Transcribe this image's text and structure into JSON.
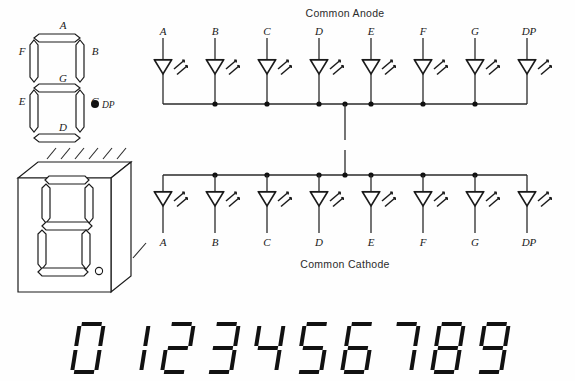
{
  "figure": {
    "segment_map": {
      "title": "seven-segment-layout",
      "segments": [
        {
          "id": "A",
          "label": "A",
          "position": "top"
        },
        {
          "id": "B",
          "label": "B",
          "position": "upper-right"
        },
        {
          "id": "C",
          "label": "C",
          "position": "lower-right"
        },
        {
          "id": "D",
          "label": "D",
          "position": "bottom"
        },
        {
          "id": "E",
          "label": "E",
          "position": "lower-left"
        },
        {
          "id": "F",
          "label": "F",
          "position": "upper-left"
        },
        {
          "id": "G",
          "label": "G",
          "position": "middle"
        }
      ],
      "decimal_point": {
        "label": "DP",
        "symbol": "filled-dot"
      }
    },
    "package_view": {
      "title": "display-package-isometric",
      "hatch_strokes": 6,
      "has_decimal_point": true
    },
    "common_anode": {
      "title": "Common Anode",
      "pins": [
        "A",
        "B",
        "C",
        "D",
        "E",
        "F",
        "G",
        "DP"
      ],
      "led_count": 8,
      "bus_position": "bottom",
      "lead_position": "top",
      "junction_dots": [
        "B",
        "C",
        "D",
        "center-tap",
        "E",
        "F",
        "G"
      ],
      "center_tap_direction": "down"
    },
    "common_cathode": {
      "title": "Common  Cathode",
      "pins": [
        "A",
        "B",
        "C",
        "D",
        "E",
        "F",
        "G",
        "DP"
      ],
      "led_count": 8,
      "bus_position": "top",
      "lead_position": "bottom",
      "junction_dots": [
        "B",
        "C",
        "D",
        "center-tap",
        "E",
        "F",
        "G"
      ],
      "center_tap_direction": "up"
    },
    "digit_row": {
      "title": "digit-glyph-row",
      "digits": [
        "0",
        "1",
        "2",
        "3",
        "4",
        "5",
        "6",
        "7",
        "8",
        "9"
      ],
      "style": "italic-seven-segment"
    },
    "colors": {
      "ink": "#1b1b1b",
      "wire": "#2a2a2a",
      "background": "#fefefe"
    }
  }
}
